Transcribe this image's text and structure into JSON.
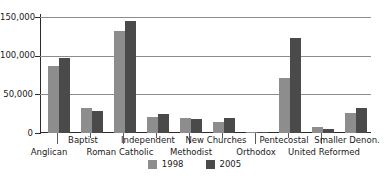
{
  "chart_data": {
    "type": "bar",
    "title": "",
    "subtitle": "",
    "xlabel": "",
    "ylabel": "",
    "ylim": [
      0,
      160000
    ],
    "grid": true,
    "legend_position": "bottom",
    "yticks": [
      "0",
      "50,000",
      "100,000",
      "150,000"
    ],
    "ytick_values": [
      0,
      50000,
      100000,
      150000
    ],
    "categories": [
      "Anglican",
      "Baptist",
      "Roman Catholic",
      "Independent",
      "Methodist",
      "New Churches",
      "Orthodox",
      "Pentecostal",
      "United Reformed",
      "Smaller Denon."
    ],
    "series": [
      {
        "name": "1998",
        "color": "#8d8d8d",
        "values": [
          93000,
          34000,
          141000,
          22000,
          21000,
          15000,
          1000,
          76000,
          8000,
          27000
        ]
      },
      {
        "name": "2005",
        "color": "#4a4a4a",
        "values": [
          103000,
          31000,
          155000,
          26000,
          19000,
          20000,
          2000,
          131000,
          6000,
          34000
        ]
      }
    ]
  },
  "legend": {
    "items": [
      {
        "label": "1998",
        "color": "#8d8d8d"
      },
      {
        "label": "2005",
        "color": "#4a4a4a"
      }
    ]
  }
}
